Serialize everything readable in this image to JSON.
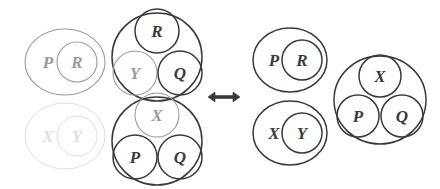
{
  "figure": {
    "relation_symbol": "⟺",
    "relation_name": "if-and-only-if-arrow",
    "background_color": "#ffffff"
  },
  "colors": {
    "ink_dark": "#3a3a3a",
    "ink_medium": "#6f6f6f",
    "ink_faint": "#9a9a9a",
    "ink_very_faint": "#cfcfcf",
    "ink_ghost": "#dedede"
  },
  "left_side": {
    "name": "left-hand-side",
    "groups": [
      {
        "id": "left-pr-pair",
        "name": "left-pr-nested-pair",
        "tone": "faint",
        "outer": {
          "cx": 65,
          "cy": 62,
          "rx": 40,
          "ry": 33,
          "tone": "faint"
        },
        "nodes": [
          {
            "label": "P",
            "cx": 48,
            "cy": 62,
            "r": 0,
            "tone": "faint",
            "circled": false
          },
          {
            "label": "R",
            "cx": 77,
            "cy": 62,
            "r": 20,
            "tone": "faint",
            "circled": true
          }
        ]
      },
      {
        "id": "left-xy-pair",
        "name": "left-xy-nested-pair",
        "tone": "ghost",
        "outer": {
          "cx": 65,
          "cy": 136,
          "rx": 40,
          "ry": 33,
          "tone": "ghost"
        },
        "nodes": [
          {
            "label": "X",
            "cx": 48,
            "cy": 136,
            "r": 0,
            "tone": "ghost",
            "circled": false
          },
          {
            "label": "Y",
            "cx": 77,
            "cy": 136,
            "r": 20,
            "tone": "ghost",
            "circled": true
          }
        ]
      },
      {
        "id": "left-ryq-cluster",
        "name": "left-ryq-cluster",
        "tone": "dark",
        "outer": {
          "cx": 157,
          "cy": 57,
          "rx": 45,
          "ry": 44,
          "tone": "dark"
        },
        "nodes": [
          {
            "label": "R",
            "cx": 157,
            "cy": 31,
            "r": 22,
            "tone": "dark",
            "circled": true
          },
          {
            "label": "Y",
            "cx": 135,
            "cy": 73,
            "r": 22,
            "tone": "faint",
            "circled": true
          },
          {
            "label": "Q",
            "cx": 180,
            "cy": 73,
            "r": 22,
            "tone": "dark",
            "circled": true
          }
        ]
      },
      {
        "id": "left-xpq-cluster",
        "name": "left-xpq-cluster",
        "tone": "dark",
        "outer": {
          "cx": 157,
          "cy": 141,
          "rx": 45,
          "ry": 44,
          "tone": "dark"
        },
        "nodes": [
          {
            "label": "X",
            "cx": 157,
            "cy": 115,
            "r": 22,
            "tone": "faint",
            "circled": true
          },
          {
            "label": "P",
            "cx": 135,
            "cy": 157,
            "r": 22,
            "tone": "dark",
            "circled": true
          },
          {
            "label": "Q",
            "cx": 180,
            "cy": 157,
            "r": 22,
            "tone": "dark",
            "circled": true
          }
        ]
      }
    ]
  },
  "right_side": {
    "name": "right-hand-side",
    "groups": [
      {
        "id": "right-pr-pair",
        "name": "right-pr-nested-pair",
        "tone": "dark",
        "outer": {
          "cx": 290,
          "cy": 60,
          "rx": 37,
          "ry": 32,
          "tone": "dark"
        },
        "nodes": [
          {
            "label": "P",
            "cx": 274,
            "cy": 60,
            "r": 0,
            "tone": "dark",
            "circled": false
          },
          {
            "label": "R",
            "cx": 302,
            "cy": 60,
            "r": 20,
            "tone": "dark",
            "circled": true
          }
        ]
      },
      {
        "id": "right-xy-pair",
        "name": "right-xy-nested-pair",
        "tone": "dark",
        "outer": {
          "cx": 290,
          "cy": 133,
          "rx": 37,
          "ry": 32,
          "tone": "dark"
        },
        "nodes": [
          {
            "label": "X",
            "cx": 274,
            "cy": 133,
            "r": 0,
            "tone": "dark",
            "circled": false
          },
          {
            "label": "Y",
            "cx": 302,
            "cy": 133,
            "r": 20,
            "tone": "dark",
            "circled": true
          }
        ]
      },
      {
        "id": "right-xpq-cluster",
        "name": "right-xpq-cluster",
        "tone": "dark",
        "outer": {
          "cx": 380,
          "cy": 100,
          "rx": 46,
          "ry": 44,
          "tone": "dark"
        },
        "nodes": [
          {
            "label": "X",
            "cx": 380,
            "cy": 76,
            "r": 21,
            "tone": "dark",
            "circled": true
          },
          {
            "label": "P",
            "cx": 358,
            "cy": 116,
            "r": 21,
            "tone": "dark",
            "circled": true
          },
          {
            "label": "Q",
            "cx": 402,
            "cy": 116,
            "r": 21,
            "tone": "dark",
            "circled": true
          }
        ]
      }
    ]
  },
  "arrow": {
    "name": "double-headed-arrow",
    "symbol": "⟺",
    "cx": 224,
    "cy": 97,
    "tone": "dark"
  },
  "all_labels": [
    "P",
    "R",
    "Y",
    "Q",
    "X"
  ]
}
